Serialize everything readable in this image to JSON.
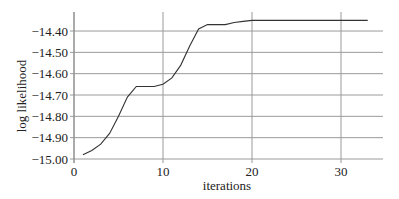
{
  "chart_data": {
    "type": "line",
    "title": "",
    "xlabel": "iterations",
    "ylabel": "log likelihood",
    "xlim": [
      0,
      35
    ],
    "ylim": [
      -15.0,
      -14.33
    ],
    "grid": {
      "horizontal": true,
      "vertical": true
    },
    "x_ticks": [
      0,
      10,
      20,
      30
    ],
    "x_tick_labels": [
      "0",
      "10",
      "20",
      "30"
    ],
    "y_ticks": [
      -15.0,
      -14.9,
      -14.8,
      -14.7,
      -14.6,
      -14.5,
      -14.4
    ],
    "y_tick_labels": [
      "-15.00",
      "-14.90",
      "-14.80",
      "-14.70",
      "-14.60",
      "-14.50",
      "-14.40"
    ],
    "legend": null,
    "series": [
      {
        "name": "log likelihood",
        "color": "#333333",
        "x": [
          1,
          2,
          3,
          4,
          5,
          6,
          7,
          8,
          9,
          10,
          11,
          12,
          13,
          14,
          15,
          16,
          17,
          18,
          19,
          20,
          21,
          22,
          23,
          24,
          25,
          26,
          27,
          28,
          29,
          30,
          31,
          32,
          33
        ],
        "values": [
          -14.98,
          -14.96,
          -14.93,
          -14.88,
          -14.8,
          -14.71,
          -14.66,
          -14.66,
          -14.66,
          -14.65,
          -14.62,
          -14.56,
          -14.47,
          -14.39,
          -14.37,
          -14.37,
          -14.37,
          -14.36,
          -14.355,
          -14.35,
          -14.35,
          -14.35,
          -14.35,
          -14.35,
          -14.35,
          -14.35,
          -14.35,
          -14.35,
          -14.35,
          -14.35,
          -14.35,
          -14.35,
          -14.35
        ]
      }
    ]
  },
  "colors": {
    "line": "#333333",
    "grid": "#9a9a9a",
    "axis": "#888888",
    "text": "#222222"
  }
}
